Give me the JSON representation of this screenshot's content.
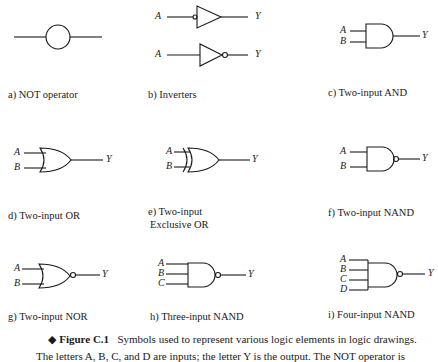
{
  "panels": [
    {
      "id": "a",
      "label": "a)  NOT operator"
    },
    {
      "id": "b",
      "label": "b)  Inverters"
    },
    {
      "id": "c",
      "label": "c)  Two-input AND"
    },
    {
      "id": "d",
      "label": "d)  Two-input OR"
    },
    {
      "id": "e",
      "label": "e)  Two-input",
      "label2": "Exclusive OR"
    },
    {
      "id": "f",
      "label": "f)  Two-input NAND"
    },
    {
      "id": "g",
      "label": "g)  Two-input NOR"
    },
    {
      "id": "h",
      "label": "h)  Three-input NAND"
    },
    {
      "id": "i",
      "label": "i)  Four-input NAND"
    }
  ],
  "pins": {
    "A": "A",
    "B": "B",
    "C": "C",
    "D": "D",
    "Y": "Y"
  },
  "caption": {
    "bullet": "◆",
    "figure": "Figure C.1",
    "text": "Symbols used to represent various logic elements in logic drawings.",
    "line2": "The letters A, B, C, and D are inputs; the letter Y is the output. The NOT operator is"
  }
}
